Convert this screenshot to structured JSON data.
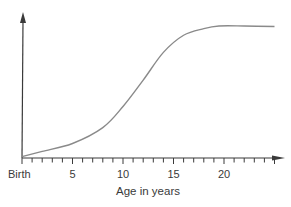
{
  "chart_data": {
    "type": "line",
    "title": "",
    "xlabel": "Age in years",
    "ylabel": "",
    "x_tick_labels": [
      {
        "value": 0,
        "label": "Birth"
      },
      {
        "value": 5,
        "label": "5"
      },
      {
        "value": 10,
        "label": "10"
      },
      {
        "value": 15,
        "label": "15"
      },
      {
        "value": 20,
        "label": "20"
      }
    ],
    "x_minor_tick_step": 1,
    "xlim": [
      0,
      25
    ],
    "ylim": [
      0,
      100
    ],
    "grid": false,
    "legend": null,
    "series": [
      {
        "name": "growth",
        "x": [
          0,
          2,
          5,
          8,
          10,
          12,
          14,
          16,
          18,
          19.5,
          22,
          25
        ],
        "y": [
          1,
          5,
          11,
          23,
          39,
          59,
          80,
          93,
          98,
          100,
          100,
          99.6
        ]
      }
    ],
    "colors": {
      "curve": "#8a8a8a",
      "axis": "#3a3a3a",
      "text": "#3a3a3a"
    }
  }
}
